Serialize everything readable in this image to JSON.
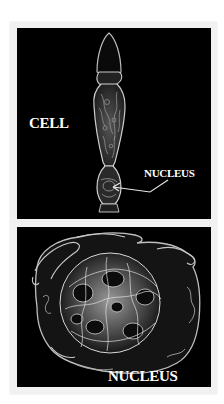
{
  "figure": {
    "top_panel": {
      "subject": "cell",
      "labels": {
        "cell": "CELL",
        "nucleus": "NUCLEUS"
      },
      "arrow": "points-to-nucleus"
    },
    "bottom_panel": {
      "subject": "nucleus",
      "labels": {
        "nucleus": "NUCLEUS"
      }
    }
  },
  "colors": {
    "panel_background": "#000000",
    "frame": "#f1f1f1",
    "label": "#ffffff",
    "structure_stroke": "#cfcfcf"
  }
}
